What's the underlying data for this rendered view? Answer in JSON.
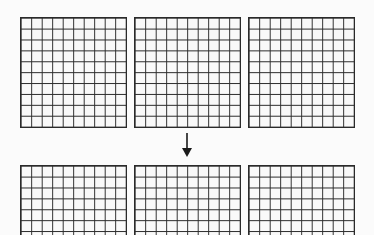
{
  "diagram": {
    "top_row": [
      {
        "rows": 10,
        "cols": 10
      },
      {
        "rows": 10,
        "cols": 10
      },
      {
        "rows": 10,
        "cols": 10
      }
    ],
    "arrow": {
      "direction": "down",
      "icon": "arrow-down-icon"
    },
    "bottom_row": [
      {
        "rows": 10,
        "cols": 10
      },
      {
        "rows": 10,
        "cols": 10
      },
      {
        "rows": 10,
        "cols": 10
      }
    ],
    "line_color": "#2a2a2a",
    "background_color": "#fbfbfb"
  }
}
